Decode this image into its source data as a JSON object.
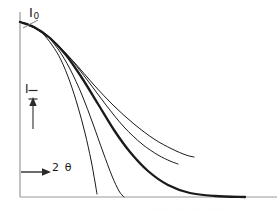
{
  "figure": {
    "background_color": "#ffffff",
    "axis_color": "#8f8f8f",
    "curve_color": "#1a1a1a",
    "annotation_color": "#1a1a1a"
  },
  "labels": {
    "i_zero_main": "I",
    "i_zero_sub": "0",
    "intensity": "I",
    "x_axis": "2 θ",
    "x_axis_arrow": "→",
    "faint_footer": "····  ···  ····  ·····"
  },
  "chart_data": {
    "type": "line",
    "title": "",
    "xlabel": "2 θ",
    "ylabel": "I",
    "grid": false,
    "legend": null,
    "axes": {
      "y_axis_from": [
        20,
        197
      ],
      "y_axis_to": [
        20,
        12
      ],
      "x_axis_from": [
        20,
        197
      ],
      "x_axis_to": [
        277,
        197
      ],
      "x_range_label": "2 θ increasing to the right",
      "y_range_label": "I increasing upward, starting at I₀"
    },
    "annotations": [
      {
        "name": "i-zero",
        "text": "I₀",
        "meaning": "initial intensity at the common curve origin",
        "leader_from": [
          38,
          22
        ],
        "leader_to": [
          23,
          27
        ],
        "point": [
          20,
          22
        ]
      },
      {
        "name": "intensity-arrow",
        "text": "I",
        "meaning": "intensity axis direction, arrow pointing up",
        "arrow_from": [
          33,
          128
        ],
        "arrow_to": [
          33,
          100
        ]
      },
      {
        "name": "two-theta-arrow",
        "text": "2 θ",
        "meaning": "scattering angle axis direction, arrow pointing right",
        "arrow_from": [
          22,
          172
        ],
        "arrow_to": [
          50,
          172
        ]
      }
    ],
    "common_origin": [
      20,
      22
    ],
    "series": [
      {
        "name": "curve-1-steepest",
        "line_width": 1,
        "description": "fastest decay, terminates partway down",
        "points": [
          [
            20,
            22
          ],
          [
            30,
            25
          ],
          [
            42,
            33
          ],
          [
            52,
            45
          ],
          [
            61,
            60
          ],
          [
            70,
            82
          ],
          [
            78,
            107
          ],
          [
            85,
            133
          ],
          [
            91,
            160
          ],
          [
            95,
            182
          ],
          [
            97,
            194
          ]
        ]
      },
      {
        "name": "curve-2-steep",
        "line_width": 1,
        "description": "fast decay reaching the baseline near the left third",
        "points": [
          [
            20,
            22
          ],
          [
            32,
            26
          ],
          [
            46,
            35
          ],
          [
            58,
            49
          ],
          [
            70,
            69
          ],
          [
            82,
            95
          ],
          [
            93,
            124
          ],
          [
            103,
            152
          ],
          [
            112,
            176
          ],
          [
            119,
            191
          ],
          [
            124,
            197
          ]
        ]
      },
      {
        "name": "curve-3-thick-main",
        "line_width": 2.3,
        "description": "bold primary curve flattening into a long tail along the axis",
        "points": [
          [
            20,
            22
          ],
          [
            34,
            27
          ],
          [
            50,
            38
          ],
          [
            66,
            55
          ],
          [
            82,
            78
          ],
          [
            98,
            104
          ],
          [
            114,
            130
          ],
          [
            130,
            152
          ],
          [
            148,
            171
          ],
          [
            168,
            185
          ],
          [
            190,
            193
          ],
          [
            215,
            196
          ],
          [
            245,
            197
          ]
        ]
      },
      {
        "name": "curve-4-shallow",
        "line_width": 1,
        "description": "intermediate slow decay ending above the axis",
        "points": [
          [
            20,
            22
          ],
          [
            35,
            28
          ],
          [
            52,
            40
          ],
          [
            70,
            58
          ],
          [
            88,
            81
          ],
          [
            106,
            105
          ],
          [
            124,
            127
          ],
          [
            142,
            144
          ],
          [
            158,
            155
          ],
          [
            170,
            161
          ],
          [
            178,
            164
          ]
        ]
      },
      {
        "name": "curve-5-slowest",
        "line_width": 1,
        "description": "slowest decay, highest residual tail on the right",
        "points": [
          [
            20,
            22
          ],
          [
            36,
            29
          ],
          [
            54,
            42
          ],
          [
            74,
            62
          ],
          [
            94,
            85
          ],
          [
            114,
            106
          ],
          [
            134,
            124
          ],
          [
            154,
            139
          ],
          [
            172,
            149
          ],
          [
            186,
            155
          ],
          [
            194,
            157
          ]
        ]
      }
    ]
  }
}
